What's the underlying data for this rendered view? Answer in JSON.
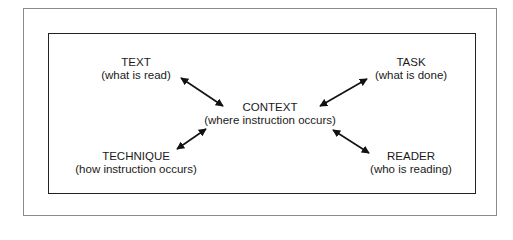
{
  "diagram": {
    "center": {
      "title": "CONTEXT",
      "subtitle": "(where instruction occurs)"
    },
    "nodes": [
      {
        "id": "text",
        "title": "TEXT",
        "subtitle": "(what is read)"
      },
      {
        "id": "task",
        "title": "TASK",
        "subtitle": "(what is done)"
      },
      {
        "id": "technique",
        "title": "TECHNIQUE",
        "subtitle": "(how instruction occurs)"
      },
      {
        "id": "reader",
        "title": "READER",
        "subtitle": "(who is reading)"
      }
    ],
    "edges": [
      {
        "from": "text",
        "to": "context",
        "type": "bidirectional"
      },
      {
        "from": "task",
        "to": "context",
        "type": "bidirectional"
      },
      {
        "from": "technique",
        "to": "context",
        "type": "bidirectional"
      },
      {
        "from": "reader",
        "to": "context",
        "type": "bidirectional"
      }
    ],
    "colors": {
      "line": "#111111",
      "outer_border": "#8a8a8a",
      "inner_border": "#222222"
    }
  }
}
